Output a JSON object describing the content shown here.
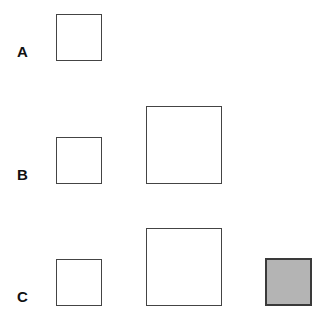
{
  "rows": [
    {
      "label": "A",
      "squares": [
        {
          "size": "small",
          "fill": "none"
        }
      ]
    },
    {
      "label": "B",
      "squares": [
        {
          "size": "small",
          "fill": "none"
        },
        {
          "size": "large",
          "fill": "none"
        }
      ]
    },
    {
      "label": "C",
      "squares": [
        {
          "size": "small",
          "fill": "none"
        },
        {
          "size": "large",
          "fill": "none"
        },
        {
          "size": "small",
          "fill": "gray"
        }
      ]
    }
  ],
  "colors": {
    "outline": "#444444",
    "gray_fill": "#b4b4b4"
  }
}
